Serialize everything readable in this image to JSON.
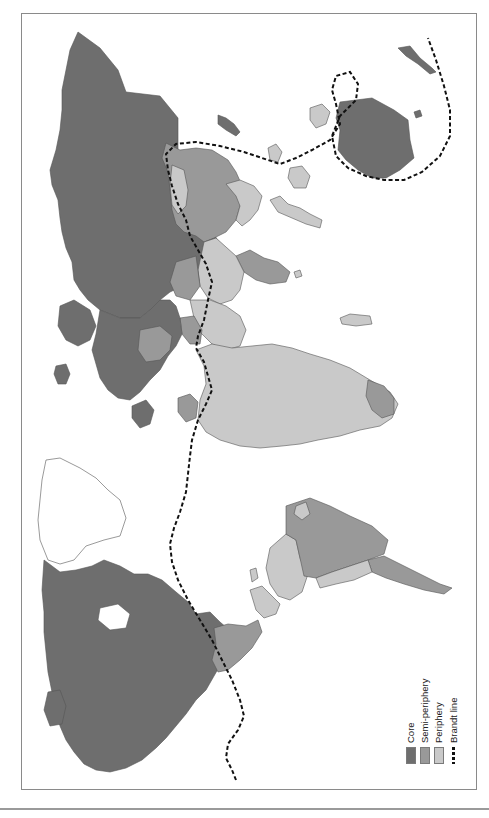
{
  "map": {
    "orientation": "rotated 90deg counter-clockwise (north to the left)",
    "colors": {
      "core": "#6e6e6e",
      "semi_periphery": "#999999",
      "periphery": "#c9c9c9",
      "unclassified": "#ffffff",
      "border": "#555555",
      "brandt_line": "#111111"
    },
    "regions": [
      {
        "name": "North America (USA, Canada)",
        "category": "core"
      },
      {
        "name": "Greenland",
        "category": "unclassified"
      },
      {
        "name": "Western Europe",
        "category": "core"
      },
      {
        "name": "Russia / former USSR",
        "category": "core"
      },
      {
        "name": "Japan",
        "category": "core"
      },
      {
        "name": "Australia",
        "category": "core"
      },
      {
        "name": "New Zealand",
        "category": "core"
      },
      {
        "name": "China",
        "category": "semi_periphery"
      },
      {
        "name": "Mexico",
        "category": "semi_periphery"
      },
      {
        "name": "Brazil",
        "category": "semi_periphery"
      },
      {
        "name": "Argentina",
        "category": "semi_periphery"
      },
      {
        "name": "India",
        "category": "semi_periphery"
      },
      {
        "name": "South Africa",
        "category": "semi_periphery"
      },
      {
        "name": "Africa (most)",
        "category": "periphery"
      },
      {
        "name": "South / Southeast Asia (most)",
        "category": "periphery"
      },
      {
        "name": "Central America",
        "category": "periphery"
      },
      {
        "name": "Andean South America",
        "category": "periphery"
      }
    ]
  },
  "legend": {
    "items": [
      {
        "label": "Core",
        "color": "#6e6e6e",
        "type": "swatch"
      },
      {
        "label": "Semi-periphery",
        "color": "#999999",
        "type": "swatch"
      },
      {
        "label": "Periphery",
        "color": "#c9c9c9",
        "type": "swatch"
      },
      {
        "label": "Brandt line",
        "color": "#111111",
        "type": "dashed-line"
      }
    ]
  }
}
